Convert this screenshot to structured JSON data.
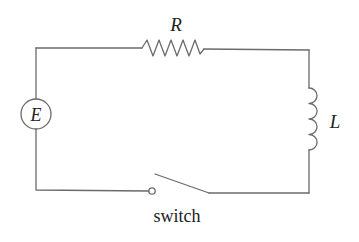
{
  "diagram": {
    "type": "RL circuit",
    "components": {
      "source": {
        "label": "E",
        "symbol": "circle"
      },
      "resistor": {
        "label": "R",
        "symbol": "zigzag"
      },
      "inductor": {
        "label": "L",
        "symbol": "coil"
      },
      "switch": {
        "label": "switch",
        "state": "open"
      }
    },
    "colors": {
      "wire": "#6b6b6b",
      "text": "#222222",
      "background": "#ffffff"
    }
  }
}
